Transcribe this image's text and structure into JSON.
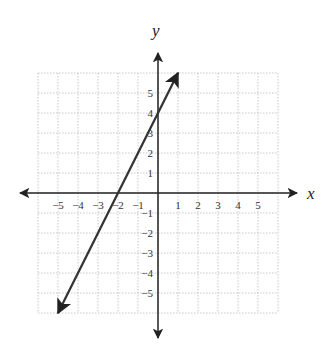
{
  "chart_data": {
    "type": "line",
    "title": "",
    "xlabel": "x",
    "ylabel": "y",
    "xlim": [
      -6,
      6
    ],
    "ylim": [
      -6,
      6
    ],
    "grid": true,
    "x_ticks": [
      "-5",
      "-4",
      "-3",
      "-2",
      "-1",
      "1",
      "2",
      "3",
      "4",
      "5"
    ],
    "y_ticks": [
      "5",
      "4",
      "3",
      "2",
      "1",
      "-1",
      "-2",
      "-3",
      "-4",
      "-5"
    ],
    "series": [
      {
        "name": "line",
        "equation": "y = 2x + 4",
        "x": [
          -5,
          -4,
          -3,
          -2,
          -1,
          0,
          1
        ],
        "y": [
          -6,
          -4,
          -2,
          0,
          2,
          4,
          6
        ],
        "x_intercept": -2,
        "y_intercept": 4,
        "color": "#333333",
        "arrows": "both"
      }
    ]
  }
}
